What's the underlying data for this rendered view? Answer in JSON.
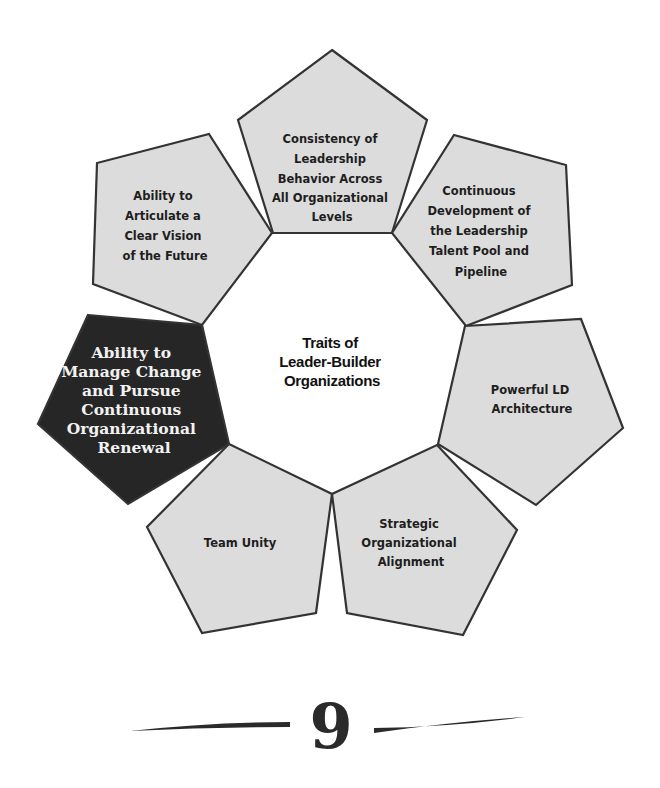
{
  "diagram": {
    "title_lines": [
      "Traits of",
      "Leader-Builder",
      "Organizations"
    ],
    "colors": {
      "pentagon_fill": "#dcdcdc",
      "pentagon_highlight_fill": "#262626",
      "outline": "#333333",
      "text": "#1e1e1e",
      "highlight_text": "#f2f2f2"
    },
    "traits": [
      {
        "id": "consistency",
        "position": "top",
        "highlighted": false,
        "lines": [
          "Consistency of",
          "Leadership",
          "Behavior Across",
          "All Organizational",
          "Levels"
        ]
      },
      {
        "id": "talent-pool",
        "position": "upper-right",
        "highlighted": false,
        "lines": [
          "Continuous",
          "Development of",
          "the Leadership",
          "Talent Pool and",
          "Pipeline"
        ]
      },
      {
        "id": "ld-architecture",
        "position": "right",
        "highlighted": false,
        "lines": [
          "Powerful LD",
          "Architecture"
        ]
      },
      {
        "id": "strategic-alignment",
        "position": "lower-right",
        "highlighted": false,
        "lines": [
          "Strategic",
          "Organizational",
          "Alignment"
        ]
      },
      {
        "id": "team-unity",
        "position": "lower-left",
        "highlighted": false,
        "lines": [
          "Team Unity"
        ]
      },
      {
        "id": "manage-change",
        "position": "left",
        "highlighted": true,
        "lines": [
          "Ability to",
          "Manage Change",
          "and Pursue",
          "Continuous",
          "Organizational",
          "Renewal"
        ]
      },
      {
        "id": "clear-vision",
        "position": "upper-left",
        "highlighted": false,
        "lines": [
          "Ability to",
          "Articulate a",
          "Clear Vision",
          "of the Future"
        ]
      }
    ]
  },
  "footer": {
    "page_number": "9"
  }
}
